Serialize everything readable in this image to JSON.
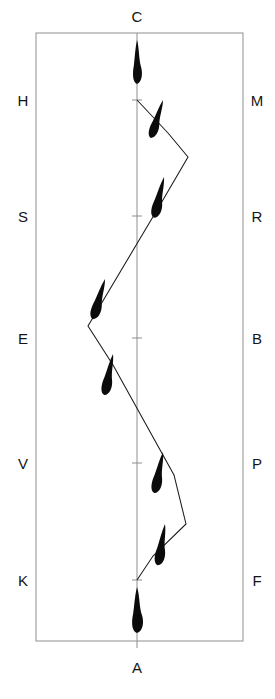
{
  "figure": {
    "title_top_label": "C",
    "title_bottom_label": "A",
    "background_color": "#ffffff",
    "frame_color": "#9a9a9a",
    "axis_color": "#8f8f8f",
    "marker_color": "#0b0b0b",
    "line_color": "#1b1b1b"
  },
  "labels": {
    "top": "C",
    "bottom": "A",
    "left": [
      "H",
      "S",
      "E",
      "V",
      "K"
    ],
    "right": [
      "M",
      "R",
      "B",
      "P",
      "F"
    ]
  },
  "chart_data": {
    "type": "line",
    "title": "",
    "subtitle": "",
    "xlabel": "",
    "ylabel": "",
    "orientation": "vertical",
    "grid": false,
    "legend_position": "none",
    "axis_top_label": "C",
    "axis_bottom_label": "A",
    "left_tick_labels": [
      "H",
      "S",
      "E",
      "V",
      "K"
    ],
    "right_tick_labels": [
      "M",
      "R",
      "B",
      "P",
      "F"
    ],
    "left_tick_y": [
      100,
      216,
      338,
      463,
      580
    ],
    "right_tick_y": [
      100,
      216,
      338,
      463,
      580
    ],
    "xlim": [
      36,
      243
    ],
    "ylim": [
      33,
      641
    ],
    "center_x": 137,
    "series": [
      {
        "name": "track",
        "x": [
          137,
          168,
          188,
          160,
          88,
          113,
          174,
          186,
          153,
          137
        ],
        "y": [
          100,
          133,
          157,
          205,
          326,
          365,
          475,
          524,
          556,
          580
        ]
      }
    ],
    "markers": [
      {
        "name": "marker-c-top",
        "x": 137,
        "y": 62,
        "angle": 0,
        "length": 44,
        "width": 9
      },
      {
        "name": "marker-upper-1",
        "x": 163,
        "y": 120,
        "angle": 18,
        "length": 40,
        "width": 9
      },
      {
        "name": "marker-upper-2",
        "x": 164,
        "y": 198,
        "angle": 14,
        "length": 42,
        "width": 10
      },
      {
        "name": "marker-mid-left",
        "x": 105,
        "y": 300,
        "angle": 17,
        "length": 42,
        "width": 10
      },
      {
        "name": "marker-mid-low",
        "x": 113,
        "y": 375,
        "angle": 12,
        "length": 42,
        "width": 10
      },
      {
        "name": "marker-lower-1",
        "x": 163,
        "y": 473,
        "angle": 12,
        "length": 42,
        "width": 10
      },
      {
        "name": "marker-lower-2",
        "x": 165,
        "y": 545,
        "angle": 10,
        "length": 42,
        "width": 10
      },
      {
        "name": "marker-a-bottom",
        "x": 137,
        "y": 610,
        "angle": 0,
        "length": 46,
        "width": 11
      }
    ],
    "center_ticks_y": [
      100,
      216,
      338,
      463,
      580
    ]
  }
}
